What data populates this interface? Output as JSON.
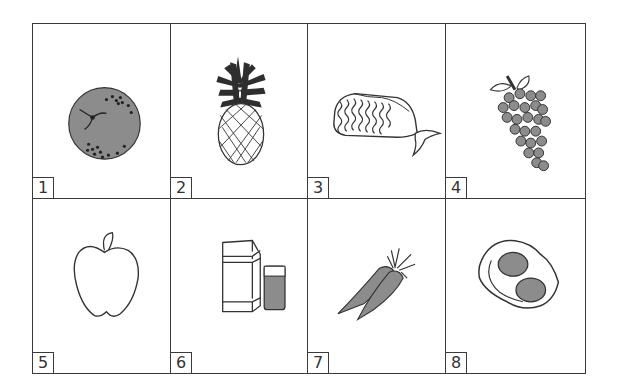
{
  "colors": {
    "line": "#3a3a3a",
    "fill": "#8c8c8c",
    "dark": "#2a2a2a"
  },
  "cards": [
    {
      "number": "1",
      "item": "orange",
      "icon": "orange-icon"
    },
    {
      "number": "2",
      "item": "pineapple",
      "icon": "pineapple-icon"
    },
    {
      "number": "3",
      "item": "bread loaf",
      "icon": "bread-icon"
    },
    {
      "number": "4",
      "item": "grapes",
      "icon": "grapes-icon"
    },
    {
      "number": "5",
      "item": "apple",
      "icon": "apple-icon"
    },
    {
      "number": "6",
      "item": "milk carton and glass",
      "icon": "milk-icon"
    },
    {
      "number": "7",
      "item": "carrots",
      "icon": "carrots-icon"
    },
    {
      "number": "8",
      "item": "fried eggs",
      "icon": "eggs-icon"
    }
  ]
}
